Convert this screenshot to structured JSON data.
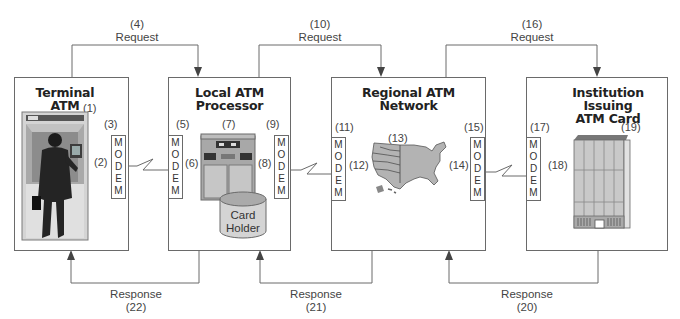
{
  "diagram": {
    "nodes": [
      {
        "id": "terminal_atm",
        "title_line1": "Terminal",
        "title_line2": "ATM",
        "ref": "(1)"
      },
      {
        "id": "local_atm_processor",
        "title_line1": "Local ATM",
        "title_line2": "Processor",
        "ref": "(7)"
      },
      {
        "id": "regional_atm_network",
        "title_line1": "Regional ATM",
        "title_line2": "Network",
        "ref": "(13)"
      },
      {
        "id": "institution_issuing_atm_card",
        "title_line1": "Institution Issuing",
        "title_line2": "ATM Card",
        "ref": "(19)"
      }
    ],
    "modem_letters": [
      "M",
      "O",
      "D",
      "E",
      "M"
    ],
    "modems": [
      {
        "ref": "(3)",
        "link_ref": "(2)"
      },
      {
        "ref": "(5)",
        "link_ref": "(6)"
      },
      {
        "ref": "(9)",
        "link_ref": "(8)"
      },
      {
        "ref": "(11)",
        "link_ref": "(12)"
      },
      {
        "ref": "(15)",
        "link_ref": "(14)"
      },
      {
        "ref": "(17)",
        "link_ref": "(18)"
      }
    ],
    "storage": {
      "line1": "Card",
      "line2": "Holder"
    },
    "requests": [
      {
        "num": "(4)",
        "label": "Request"
      },
      {
        "num": "(10)",
        "label": "Request"
      },
      {
        "num": "(16)",
        "label": "Request"
      }
    ],
    "responses": [
      {
        "label": "Response",
        "num": "(22)"
      },
      {
        "label": "Response",
        "num": "(21)"
      },
      {
        "label": "Response",
        "num": "(20)"
      }
    ],
    "colors": {
      "line": "#6a6a6a",
      "map_fill": "#b3b3b3",
      "machine_fill": "#a8a8a8",
      "building_fill": "#c9c9c9"
    }
  }
}
